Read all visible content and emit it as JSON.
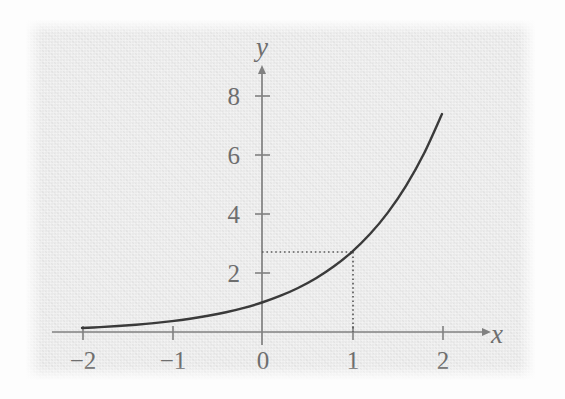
{
  "figure": {
    "kind": "function-graph",
    "background_color": "#e9e9e9",
    "page_color": "#fdfdfd",
    "axis_color": "#808080",
    "curve_color": "#3a3a3a",
    "guide_color": "#5c5c5c",
    "label_color": "#6e6e6e"
  },
  "chart_data": {
    "type": "line",
    "title": "",
    "subtitle": "",
    "xlabel": "x",
    "ylabel": "y",
    "function": "y = e^x",
    "xlim": [
      -2.35,
      2.55
    ],
    "ylim": [
      -0.55,
      9.1
    ],
    "xticks": [
      -2,
      -1,
      0,
      1,
      2
    ],
    "xtick_labels": [
      "−2",
      "−1",
      "0",
      "1",
      "2"
    ],
    "yticks": [
      2,
      4,
      6,
      8
    ],
    "ytick_labels": [
      "2",
      "4",
      "6",
      "8"
    ],
    "grid": false,
    "legend": null,
    "axis_arrows": {
      "x_positive": true,
      "y_positive": true
    },
    "series": [
      {
        "name": "y = e^x",
        "x": [
          -2.0,
          -1.8,
          -1.6,
          -1.4,
          -1.2,
          -1.0,
          -0.8,
          -0.6,
          -0.4,
          -0.2,
          0.0,
          0.2,
          0.4,
          0.6,
          0.8,
          1.0,
          1.2,
          1.4,
          1.6,
          1.8,
          2.0
        ],
        "y": [
          0.135,
          0.165,
          0.202,
          0.247,
          0.301,
          0.368,
          0.449,
          0.549,
          0.67,
          0.819,
          1.0,
          1.221,
          1.492,
          1.822,
          2.226,
          2.718,
          3.32,
          4.055,
          4.953,
          6.05,
          7.389
        ]
      }
    ],
    "annotations": [
      {
        "name": "point-at-x-equals-1",
        "x": 1,
        "y": 2.718,
        "guide_style": "dotted",
        "guides": [
          "horizontal-to-y-axis",
          "vertical-to-x-axis"
        ],
        "label": ""
      }
    ]
  }
}
